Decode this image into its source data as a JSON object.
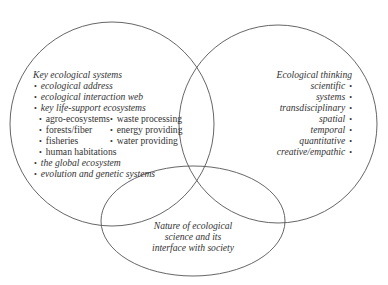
{
  "left_set": {
    "title": "Key ecological systems",
    "items": [
      "ecological address",
      "ecological interaction web",
      "key life-support ecosystems"
    ],
    "sub_col1": [
      "agro-ecosystems",
      "forests/fiber",
      "fisheries",
      "human habitations"
    ],
    "sub_col2": [
      "waste processing",
      "energy providing",
      "water providing"
    ],
    "items_after": [
      "the global ecosystem",
      "evolution and genetic systems"
    ]
  },
  "right_set": {
    "title": "Ecological thinking",
    "items": [
      "scientific",
      "systems",
      "transdisciplinary",
      "spatial",
      "temporal",
      "quantitative",
      "creative/empathic"
    ]
  },
  "bottom_set": {
    "lines": [
      "Nature of ecological",
      "science and its",
      "interface with society"
    ]
  }
}
